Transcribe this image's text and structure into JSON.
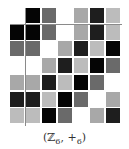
{
  "caption": {
    "group": "ℤ",
    "order": "6",
    "op": "+",
    "op_sub": "6"
  },
  "elements": [
    0,
    1,
    2,
    3,
    4,
    5
  ],
  "element_colors": [
    "#050505",
    "#6a6a6a",
    "#ffffff",
    "#a8a8a8",
    "#1e1e1e",
    "#bcbcbc"
  ],
  "header_row": [
    null,
    0,
    1,
    2,
    3,
    4,
    5
  ],
  "table": [
    [
      0,
      0,
      1,
      2,
      3,
      4,
      5
    ],
    [
      1,
      1,
      2,
      3,
      4,
      5,
      0
    ],
    [
      2,
      2,
      3,
      4,
      5,
      0,
      1
    ],
    [
      3,
      3,
      4,
      5,
      0,
      1,
      2
    ],
    [
      4,
      4,
      5,
      0,
      1,
      2,
      3
    ],
    [
      5,
      5,
      0,
      1,
      2,
      3,
      4
    ]
  ]
}
